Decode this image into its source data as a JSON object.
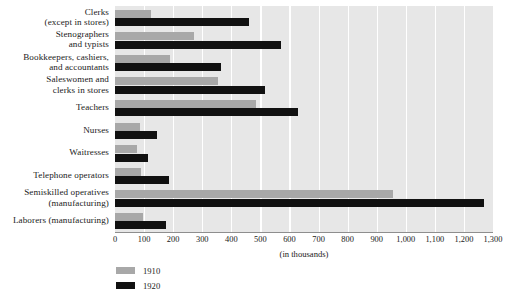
{
  "chart_data": {
    "type": "bar",
    "orientation": "horizontal",
    "title": "",
    "subtitle": "",
    "xlabel": "(in thousands)",
    "ylabel": "",
    "xlim": [
      0,
      1300
    ],
    "xticks": [
      "0",
      "100",
      "200",
      "300",
      "400",
      "500",
      "600",
      "700",
      "800",
      "900",
      "1,000",
      "1,100",
      "1,200",
      "1,300"
    ],
    "xtick_values": [
      0,
      100,
      200,
      300,
      400,
      500,
      600,
      700,
      800,
      900,
      1000,
      1100,
      1200,
      1300
    ],
    "grid": true,
    "grid_axis": "x",
    "legend_position": "bottom-left",
    "categories": [
      "Clerks\n(except in stores)",
      "Stenographers\nand typists",
      "Bookkeepers, cashiers,\nand accountants",
      "Saleswomen and\nclerks in stores",
      "Teachers",
      "Nurses",
      "Waitresses",
      "Telephone operators",
      "Semiskilled operatives\n(manufacturing)",
      "Laborers (manufacturing)"
    ],
    "series": [
      {
        "name": "1910",
        "color": "#a8a8a8",
        "values": [
          125,
          270,
          190,
          355,
          485,
          85,
          75,
          90,
          955,
          95
        ]
      },
      {
        "name": "1920",
        "color": "#111111",
        "values": [
          460,
          570,
          365,
          515,
          630,
          145,
          115,
          185,
          1270,
          175
        ]
      }
    ]
  },
  "legend": {
    "entries": [
      {
        "label": "1910",
        "color": "#a8a8a8"
      },
      {
        "label": "1920",
        "color": "#111111"
      }
    ]
  },
  "colors": {
    "plot_background": "#e7e7e7",
    "gridline": "#ffffff",
    "axis": "#8e8e8e",
    "text": "#1a1a1a"
  }
}
